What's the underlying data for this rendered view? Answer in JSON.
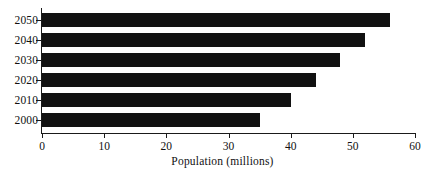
{
  "chart_data": {
    "type": "bar",
    "orientation": "horizontal",
    "title": "",
    "subtitle": "",
    "xlabel": "Population (millions)",
    "ylabel": "",
    "categories": [
      "2050",
      "2040",
      "2030",
      "2020",
      "2010",
      "2000"
    ],
    "values": [
      56,
      52,
      48,
      44,
      40,
      35
    ],
    "series": [
      {
        "name": "Population",
        "values": [
          56,
          52,
          48,
          44,
          40,
          35
        ]
      }
    ],
    "xlim": [
      0,
      60
    ],
    "xticks": [
      0,
      10,
      20,
      30,
      40,
      50,
      60
    ],
    "xtick_labels": [
      "0",
      "10",
      "20",
      "30",
      "40",
      "50",
      "60"
    ],
    "ytick_labels": [
      "2050",
      "2040",
      "2030",
      "2020",
      "2010",
      "2000"
    ],
    "grid": false,
    "legend": false,
    "legend_position": "none",
    "bar_color": "#111111",
    "background_color": "#ffffff",
    "axis_color": "#1a1a1a"
  }
}
